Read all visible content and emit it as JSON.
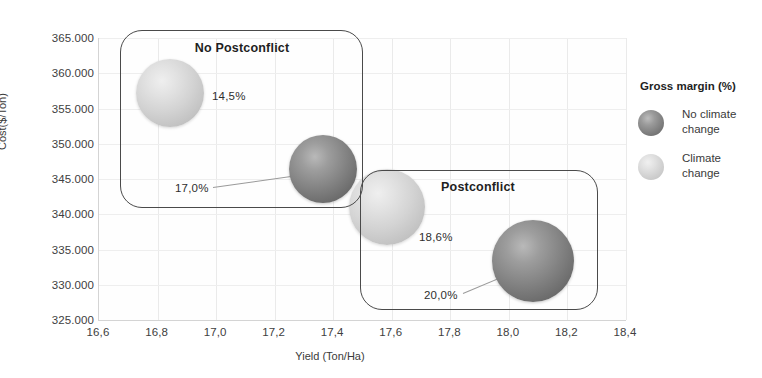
{
  "chart_data": {
    "type": "scatter",
    "title": "",
    "xlabel": "Yield (Ton/Ha)",
    "ylabel": "Cost($/Ton)",
    "xlim": [
      16.6,
      18.4
    ],
    "ylim": [
      325000,
      365000
    ],
    "xticks": [
      "16,6",
      "16,8",
      "17,0",
      "17,2",
      "17,4",
      "17,6",
      "17,8",
      "18,0",
      "18,2",
      "18,4"
    ],
    "yticks": [
      "325.000",
      "330.000",
      "335.000",
      "340.000",
      "345.000",
      "350.000",
      "355.000",
      "360.000",
      "365.000"
    ],
    "grid": true,
    "legend": {
      "title": "Gross margin (%)",
      "position": "right",
      "entries": [
        {
          "name": "No climate change",
          "label": "No climate\nchange",
          "series": "dark",
          "color": "#7a7a7a"
        },
        {
          "name": "Climate change",
          "label": "Climate\nchange",
          "series": "light",
          "color": "#d0d0d0"
        }
      ]
    },
    "points": [
      {
        "label": "14,5%",
        "x": 16.85,
        "y": 357200,
        "size": 14.5,
        "series": "Climate change",
        "style": "light",
        "px": 170,
        "py": 93,
        "r": 34,
        "label_px": 212,
        "label_py": 96,
        "leader": null
      },
      {
        "label": "17,0%",
        "x": 17.37,
        "y": 346400,
        "size": 17.0,
        "series": "No climate change",
        "style": "dark",
        "px": 323,
        "py": 169,
        "r": 34,
        "label_px": 175,
        "label_py": 188,
        "leader": {
          "x1": 213,
          "y1": 187,
          "x2": 305,
          "y2": 174
        }
      },
      {
        "label": "18,6%",
        "x": 17.6,
        "y": 341600,
        "size": 18.6,
        "series": "Climate change",
        "style": "light",
        "px": 387,
        "py": 207,
        "r": 38,
        "label_px": 419,
        "label_py": 237,
        "leader": null
      },
      {
        "label": "20,0%",
        "x": 18.09,
        "y": 333300,
        "size": 20.0,
        "series": "No climate change",
        "style": "dark",
        "px": 533,
        "py": 261,
        "r": 41,
        "label_px": 424,
        "label_py": 295,
        "leader": {
          "x1": 463,
          "y1": 293,
          "x2": 513,
          "y2": 272
        }
      }
    ],
    "annotations": [
      {
        "name": "no-postconflict",
        "text": "No Postconflict",
        "box": {
          "left": 120,
          "top": 30,
          "width": 243,
          "height": 178
        },
        "title_px": 242,
        "title_py": 48
      },
      {
        "name": "postconflict",
        "text": "Postconflict",
        "box": {
          "left": 360,
          "top": 170,
          "width": 238,
          "height": 140
        },
        "title_px": 478,
        "title_py": 187
      }
    ]
  }
}
